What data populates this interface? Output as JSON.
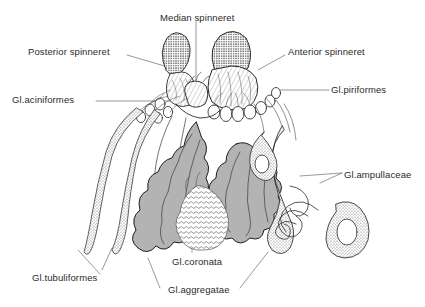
{
  "figure": {
    "background_color": "#ffffff",
    "ink_color": "#2b2b2b",
    "gland_fill_gray": "#b3b3b3",
    "stipple_fill": "#d8d8d8"
  },
  "labels": [
    {
      "key": "median_spinneret",
      "text": "Median spinneret",
      "x": 160,
      "y": 12
    },
    {
      "key": "posterior_spinneret",
      "text": "Posterior spinneret",
      "x": 28,
      "y": 46
    },
    {
      "key": "anterior_spinneret",
      "text": "Anterior spinneret",
      "x": 288,
      "y": 46
    },
    {
      "key": "gl_aciniformes",
      "text": "Gl.aciniformes",
      "x": 12,
      "y": 94
    },
    {
      "key": "gl_piriformes",
      "text": "Gl.piriformes",
      "x": 331,
      "y": 84
    },
    {
      "key": "gl_ampullaceae",
      "text": "Gl.ampullaceae",
      "x": 344,
      "y": 169
    },
    {
      "key": "gl_tubuliformes",
      "text": "Gl.tubuliformes",
      "x": 32,
      "y": 272
    },
    {
      "key": "gl_coronata",
      "text": "Gl.coronata",
      "x": 172,
      "y": 256
    },
    {
      "key": "gl_aggregatae",
      "text": "Gl.aggregatae",
      "x": 168,
      "y": 284
    }
  ],
  "structures": [
    {
      "key": "median-spinneret-pair",
      "name": "median spinneret",
      "texture": "stippled-dense"
    },
    {
      "key": "posterior-spinneret",
      "name": "posterior spinneret",
      "texture": "stippled-dense"
    },
    {
      "key": "anterior-spinneret",
      "name": "anterior spinneret",
      "texture": "hatched"
    },
    {
      "key": "aciniform-glands",
      "name": "Gl.aciniformes",
      "texture": "clustered-lobes"
    },
    {
      "key": "piriform-glands",
      "name": "Gl.piriformes",
      "texture": "small-lobes"
    },
    {
      "key": "ampullate-glands",
      "name": "Gl.ampullaceae",
      "texture": "stippled-sac"
    },
    {
      "key": "tubuliform-glands",
      "name": "Gl.tubuliformes",
      "texture": "stippled-tube"
    },
    {
      "key": "coronate-gland",
      "name": "Gl.coronata",
      "texture": "fine-reticulate"
    },
    {
      "key": "aggregate-glands",
      "name": "Gl.aggregatae",
      "texture": "gray-lobed-mass"
    }
  ]
}
